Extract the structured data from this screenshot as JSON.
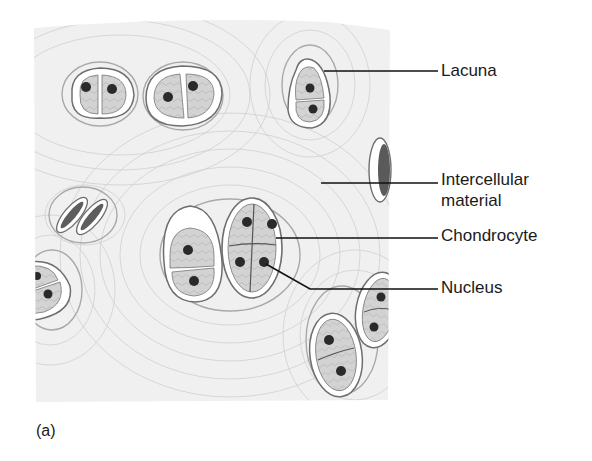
{
  "figure": {
    "panel_label": "(a)",
    "labels": [
      {
        "id": "lacuna",
        "text": "Lacuna"
      },
      {
        "id": "intercellular",
        "text": "Intercellular",
        "text2": "material"
      },
      {
        "id": "chondrocyte",
        "text": "Chondrocyte"
      },
      {
        "id": "nucleus",
        "text": "Nucleus"
      }
    ],
    "colors": {
      "matrix": "#f1f1f1",
      "matrix_lines": "#c8c8c8",
      "capsule": "#ffffff",
      "capsule_ring": "#7a7a7a",
      "cytoplasm": "#cfcfcf",
      "nucleus": "#2a2a2a",
      "leader_line": "#111111",
      "text": "#1a1a1a"
    }
  }
}
